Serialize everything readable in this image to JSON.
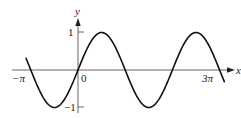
{
  "chart_data": {
    "type": "line",
    "title": "",
    "function": "y = sin(x)",
    "xlabel": "x",
    "ylabel": "y",
    "x_tick_labels": [
      "−π",
      "0",
      "3π"
    ],
    "y_tick_labels": [
      "1",
      "−1"
    ],
    "x_range": [
      -3.4,
      9.8
    ],
    "y_range": [
      -1.1,
      1.1
    ],
    "grid": false,
    "legend": null,
    "series": [
      {
        "name": "sin(x)",
        "x": [
          -3.46,
          -3.1416,
          -2.3562,
          -1.5708,
          -0.7854,
          0,
          0.7854,
          1.5708,
          2.3562,
          3.1416,
          3.927,
          4.7124,
          5.4978,
          6.2832,
          7.0686,
          7.854,
          8.6394,
          9.4248,
          9.74
        ],
        "values": [
          0.31,
          0,
          -0.707,
          -1,
          -0.707,
          0,
          0.707,
          1,
          0.707,
          0,
          -0.707,
          -1,
          -0.707,
          0,
          0.707,
          1,
          0.707,
          0,
          -0.31
        ]
      }
    ]
  },
  "labels": {
    "x_axis": "x",
    "y_axis": "y",
    "neg_pi": "−π",
    "zero": "0",
    "three_pi": "3π",
    "one": "1",
    "neg_one": "−1"
  }
}
